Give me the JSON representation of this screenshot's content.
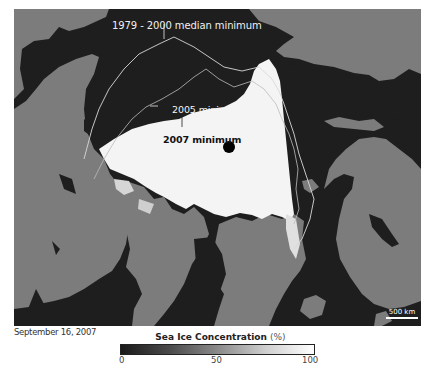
{
  "map": {
    "labels": {
      "median": "1979 - 2000 median minimum",
      "min2005": "2005 minimum",
      "min2007": "2007 minimum"
    },
    "scale_bar": "500 km",
    "colors": {
      "ocean": "#1e1e1e",
      "land": "#7c7c7c",
      "ice": "#f4f4f4",
      "contour": "#d8d8d8",
      "pole_marker": "#000000"
    }
  },
  "date": "September 16, 2007",
  "legend": {
    "title": "Sea Ice Concentration",
    "unit": "(%)",
    "ticks": [
      "0",
      "50",
      "100"
    ],
    "min": 0,
    "max": 100
  }
}
